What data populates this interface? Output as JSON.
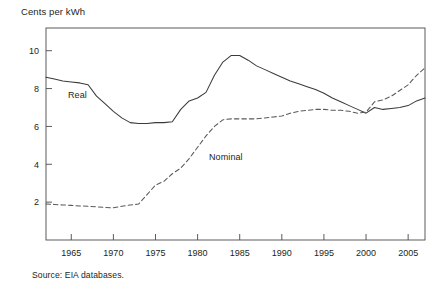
{
  "figure": {
    "y_axis_title": "Cents per kWh",
    "source_note": "Source: EIA databases."
  },
  "labels": {
    "real": "Real",
    "nominal": "Nominal"
  },
  "chart_data": {
    "type": "line",
    "title": "",
    "subtitle": "",
    "xlabel": "",
    "ylabel": "Cents per kWh",
    "xlim": [
      1962,
      2007
    ],
    "ylim": [
      0,
      11.2
    ],
    "xticks": [
      1965,
      1970,
      1975,
      1980,
      1985,
      1990,
      1995,
      2000,
      2005
    ],
    "xtick_labels": [
      "1965",
      "1970",
      "1975",
      "1980",
      "1985",
      "1990",
      "1995",
      "2000",
      "2005"
    ],
    "yticks": [
      2,
      4,
      6,
      8,
      10
    ],
    "ytick_labels": [
      "2",
      "4",
      "6",
      "8",
      "10"
    ],
    "grid": false,
    "legend": "inline-annotations",
    "annotations": [
      {
        "text": "Real",
        "x": 1967.5,
        "y": 8.25
      },
      {
        "text": "Nominal",
        "x": 1981.5,
        "y": 4.6
      }
    ],
    "x": [
      1962,
      1963,
      1964,
      1965,
      1966,
      1967,
      1968,
      1969,
      1970,
      1971,
      1972,
      1973,
      1974,
      1975,
      1976,
      1977,
      1978,
      1979,
      1980,
      1981,
      1982,
      1983,
      1984,
      1985,
      1986,
      1987,
      1988,
      1989,
      1990,
      1991,
      1992,
      1993,
      1994,
      1995,
      1996,
      1997,
      1998,
      1999,
      2000,
      2001,
      2002,
      2003,
      2004,
      2005,
      2006,
      2007
    ],
    "series": [
      {
        "name": "Real",
        "style": "solid",
        "color": "#3a3a3a",
        "values": [
          8.6,
          8.5,
          8.4,
          8.35,
          8.3,
          8.2,
          7.6,
          7.2,
          6.8,
          6.45,
          6.2,
          6.15,
          6.15,
          6.2,
          6.2,
          6.25,
          6.9,
          7.35,
          7.5,
          7.8,
          8.7,
          9.4,
          9.75,
          9.75,
          9.5,
          9.2,
          9.0,
          8.8,
          8.6,
          8.4,
          8.25,
          8.1,
          7.95,
          7.75,
          7.5,
          7.3,
          7.1,
          6.9,
          6.7,
          7.0,
          6.9,
          6.95,
          7.0,
          7.1,
          7.35,
          7.5
        ]
      },
      {
        "name": "Nominal",
        "style": "dashed",
        "color": "#5a5a5a",
        "values": [
          1.9,
          1.88,
          1.85,
          1.83,
          1.8,
          1.78,
          1.75,
          1.72,
          1.7,
          1.78,
          1.85,
          1.9,
          2.4,
          2.9,
          3.1,
          3.5,
          3.8,
          4.3,
          4.9,
          5.5,
          6.0,
          6.35,
          6.4,
          6.4,
          6.4,
          6.4,
          6.45,
          6.5,
          6.55,
          6.7,
          6.8,
          6.85,
          6.9,
          6.9,
          6.85,
          6.85,
          6.8,
          6.7,
          6.75,
          7.3,
          7.4,
          7.6,
          7.9,
          8.2,
          8.7,
          9.1
        ]
      }
    ]
  }
}
